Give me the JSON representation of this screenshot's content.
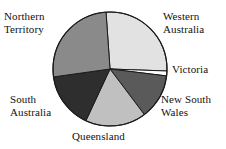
{
  "chart_data": {
    "type": "pie",
    "title": "",
    "subtitle": "",
    "xlabel": "",
    "ylabel": "",
    "legend_position": "none",
    "grid": false,
    "labels_position": "outside",
    "categories": [
      "Western Australia",
      "Victoria",
      "New South Wales",
      "Queensland",
      "South Australia",
      "Northern Territory"
    ],
    "values": [
      26.7,
      1.4,
      12.8,
      17.2,
      15.8,
      26.1
    ],
    "unit": "percent",
    "slices": [
      {
        "label": "Western Australia",
        "value": 26.7,
        "start_angle": -4,
        "end_angle": 92,
        "sweep": 96,
        "color": "#e2e2e2"
      },
      {
        "label": "Victoria",
        "value": 1.4,
        "start_angle": 92,
        "end_angle": 97,
        "sweep": 5,
        "color": "#fdfdfd"
      },
      {
        "label": "New South Wales",
        "value": 12.8,
        "start_angle": 97,
        "end_angle": 143,
        "sweep": 46,
        "color": "#5a5a5a"
      },
      {
        "label": "Queensland",
        "value": 17.2,
        "start_angle": 143,
        "end_angle": 205,
        "sweep": 62,
        "color": "#c0c0c0"
      },
      {
        "label": "South Australia",
        "value": 15.8,
        "start_angle": 205,
        "end_angle": 262,
        "sweep": 57,
        "color": "#2e2e2e"
      },
      {
        "label": "Northern Territory",
        "value": 26.1,
        "start_angle": 262,
        "end_angle": 356,
        "sweep": 94,
        "color": "#8a8a8a"
      }
    ],
    "geometry": {
      "center_x": 110,
      "center_y": 69,
      "radius": 57
    },
    "colors": {
      "outline": "#1a1a1a",
      "background": "#ffffff",
      "text": "#111111"
    }
  },
  "labels": {
    "northern_territory": "Northern\nTerritory",
    "western_australia": "Western\nAustralia",
    "victoria": "Victoria",
    "new_south_wales": "New South\nWales",
    "south_australia": "South\nAustralia",
    "queensland": "Queensland"
  }
}
